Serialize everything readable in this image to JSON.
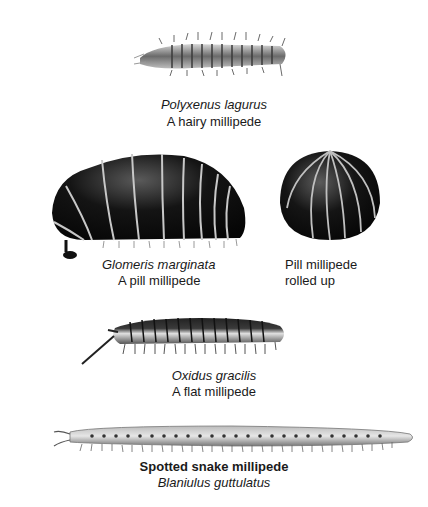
{
  "plate": {
    "specimens": [
      {
        "id": "hairy",
        "scientific_name": "Polyxenus lagurus",
        "common_name": "A hairy millipede",
        "icon": "hairy-millipede-illustration"
      },
      {
        "id": "pill",
        "scientific_name": "Glomeris marginata",
        "common_name": "A pill millipede",
        "icon": "pill-millipede-illustration"
      },
      {
        "id": "pill-rolled",
        "common_name_line1": "Pill millipede",
        "common_name_line2": "rolled up",
        "icon": "rolled-pill-millipede-illustration"
      },
      {
        "id": "flat",
        "scientific_name": "Oxidus gracilis",
        "common_name": "A flat millipede",
        "icon": "flat-millipede-illustration"
      },
      {
        "id": "snake",
        "common_name": "Spotted snake millipede",
        "scientific_name": "Blaniulus guttulatus",
        "icon": "snake-millipede-illustration"
      }
    ]
  },
  "colors": {
    "background": "#ffffff",
    "body_dark": "#141414",
    "segment_light": "#c8c8c8",
    "text": "#1a1a1a"
  }
}
